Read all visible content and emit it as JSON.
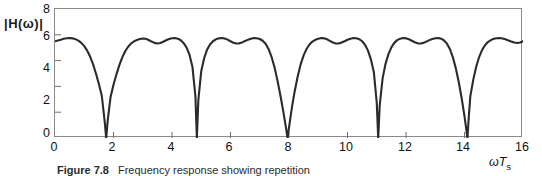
{
  "figure": {
    "caption_label": "Figure 7.8",
    "caption_text": "Frequency response showing repetition"
  },
  "axes": {
    "ylabel": "|H(ω)|",
    "xlabel_main": "ωT",
    "xlabel_sub": "s",
    "yticks": [
      "8",
      "6",
      "4",
      "2",
      "0"
    ],
    "xticks": [
      "0",
      "2",
      "4",
      "6",
      "8",
      "10",
      "12",
      "14",
      "16"
    ]
  },
  "colors": {
    "curve": "#2b2b2b",
    "frame": "#8a8a8a",
    "text": "#111111"
  },
  "chart_data": {
    "type": "line",
    "title": "Frequency response showing repetition",
    "xlabel": "ωTs",
    "ylabel": "|H(ω)|",
    "xlim": [
      0,
      16
    ],
    "ylim": [
      0,
      8
    ],
    "xticks": [
      0,
      2,
      4,
      6,
      8,
      10,
      12,
      14,
      16
    ],
    "yticks": [
      0,
      2,
      4,
      6,
      8
    ],
    "grid": false,
    "legend": "none",
    "period": 3.14,
    "zeros": [
      1.75,
      4.85,
      7.95,
      11.05,
      14.15
    ],
    "peak_value": 6.2,
    "plateau_dip_value": 5.85,
    "series": [
      {
        "name": "|H(ω)|",
        "x": [
          0.0,
          0.1,
          0.2,
          0.3,
          0.4,
          0.5,
          0.6,
          0.7,
          0.8,
          0.9,
          1.0,
          1.1,
          1.2,
          1.3,
          1.4,
          1.5,
          1.6,
          1.7,
          1.75,
          1.8,
          1.9,
          2.0,
          2.1,
          2.2,
          2.3,
          2.4,
          2.5,
          2.6,
          2.7,
          2.8,
          2.9,
          3.0,
          3.1,
          3.2,
          3.3,
          3.4,
          3.5,
          3.6,
          3.7,
          3.8,
          3.9,
          4.0,
          4.1,
          4.2,
          4.3,
          4.4,
          4.5,
          4.6,
          4.7,
          4.8,
          4.85,
          4.9,
          5.0,
          5.1,
          5.2,
          5.3,
          5.4,
          5.5,
          5.6,
          5.7,
          5.8,
          5.9,
          6.0,
          6.1,
          6.2,
          6.3,
          6.4,
          6.5,
          6.6,
          6.7,
          6.8,
          6.9,
          7.0,
          7.1,
          7.2,
          7.3,
          7.4,
          7.5,
          7.6,
          7.7,
          7.8,
          7.9,
          7.95,
          8.0,
          8.1,
          8.2,
          8.3,
          8.4,
          8.5,
          8.6,
          8.7,
          8.8,
          8.9,
          9.0,
          9.1,
          9.2,
          9.3,
          9.4,
          9.5,
          9.6,
          9.7,
          9.8,
          9.9,
          10.0,
          10.1,
          10.2,
          10.3,
          10.4,
          10.5,
          10.6,
          10.7,
          10.8,
          10.9,
          11.0,
          11.05,
          11.1,
          11.2,
          11.3,
          11.4,
          11.5,
          11.6,
          11.7,
          11.8,
          11.9,
          12.0,
          12.1,
          12.2,
          12.3,
          12.4,
          12.5,
          12.6,
          12.7,
          12.8,
          12.9,
          13.0,
          13.1,
          13.2,
          13.3,
          13.4,
          13.5,
          13.6,
          13.7,
          13.8,
          13.9,
          14.0,
          14.1,
          14.15,
          14.2,
          14.3,
          14.4,
          14.5,
          14.6,
          14.7,
          14.8,
          14.9,
          15.0,
          15.1,
          15.2,
          15.3,
          15.4,
          15.5,
          15.6,
          15.7,
          15.8,
          15.9,
          16.0
        ],
        "y": [
          6.0,
          6.05,
          6.1,
          6.16,
          6.19,
          6.2,
          6.18,
          6.13,
          6.04,
          5.9,
          5.7,
          5.42,
          5.05,
          4.58,
          4.0,
          3.35,
          2.62,
          1.0,
          0.0,
          1.05,
          2.55,
          3.3,
          3.95,
          4.52,
          5.0,
          5.38,
          5.66,
          5.86,
          5.99,
          6.08,
          6.14,
          6.17,
          6.15,
          6.08,
          5.98,
          5.9,
          5.86,
          5.89,
          5.97,
          6.06,
          6.14,
          6.19,
          6.2,
          6.16,
          6.06,
          5.88,
          5.6,
          5.15,
          4.4,
          2.6,
          0.0,
          2.35,
          4.15,
          4.95,
          5.48,
          5.8,
          6.0,
          6.12,
          6.18,
          6.2,
          6.17,
          6.1,
          6.0,
          5.91,
          5.86,
          5.87,
          5.93,
          6.02,
          6.1,
          6.16,
          6.2,
          6.19,
          6.14,
          6.03,
          5.84,
          5.52,
          5.05,
          4.42,
          3.62,
          2.7,
          1.7,
          0.6,
          0.0,
          0.65,
          1.9,
          2.95,
          3.85,
          4.58,
          5.12,
          5.52,
          5.8,
          5.98,
          6.09,
          6.16,
          6.2,
          6.18,
          6.12,
          6.02,
          5.92,
          5.86,
          5.86,
          5.92,
          6.0,
          6.09,
          6.16,
          6.2,
          6.19,
          6.13,
          6.0,
          5.78,
          5.42,
          4.88,
          4.1,
          2.2,
          0.0,
          2.0,
          3.7,
          4.6,
          5.2,
          5.62,
          5.9,
          6.07,
          6.16,
          6.2,
          6.18,
          6.12,
          6.03,
          5.94,
          5.87,
          5.86,
          5.9,
          5.98,
          6.07,
          6.14,
          6.19,
          6.2,
          6.16,
          6.05,
          5.85,
          5.52,
          5.02,
          4.35,
          3.5,
          2.5,
          1.35,
          0.0,
          1.4,
          2.6,
          3.62,
          4.42,
          5.02,
          5.45,
          5.75,
          5.95,
          6.07,
          6.15,
          6.19,
          6.2,
          6.17,
          6.12,
          6.05,
          5.98,
          5.92,
          5.89,
          5.92,
          6.0
        ]
      }
    ]
  }
}
